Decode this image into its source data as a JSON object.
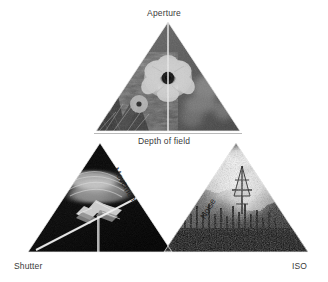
{
  "figure": {
    "type": "exposure-triangle-diagram",
    "background_color": "#ffffff",
    "label_color": "#3a3a3a",
    "edge_label_color": "#1d1d1d"
  },
  "corners": {
    "top": "Aperture",
    "bottom_left": "Shutter",
    "bottom_right": "ISO"
  },
  "edges": {
    "top_inner": "Depth of field",
    "left_inner": "Movement",
    "right_inner": "Noise"
  },
  "panels": [
    {
      "id": "aperture-panel",
      "position": "top",
      "corner_label": "Aperture",
      "edge_label": "Depth of field",
      "image_description": "black-and-white close-up photograph of a flower with a vertical split line comparing shallow and deep depth of field",
      "tone": "mid-gray"
    },
    {
      "id": "shutter-panel",
      "position": "bottom-left",
      "corner_label": "Shutter",
      "edge_label": "Movement",
      "image_description": "dark black-and-white long-exposure photograph of a motion-blurred spinning subject with a bright diagonal streak",
      "tone": "dark"
    },
    {
      "id": "iso-panel",
      "position": "bottom-right",
      "corner_label": "ISO",
      "edge_label": "Noise",
      "image_description": "high-contrast grainy black-and-white night photograph of a bright smoky scene with silhouetted structures",
      "tone": "bright-grainy"
    }
  ]
}
